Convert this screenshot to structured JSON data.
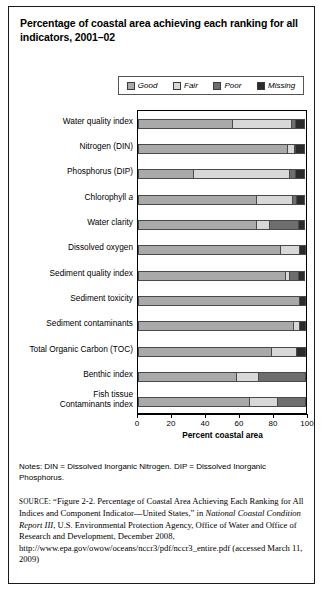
{
  "title": "Percentage of coastal area achieving each ranking for all indicators, 2001–02",
  "legend": {
    "items": [
      {
        "label": "Good",
        "color": "#a9a9a9"
      },
      {
        "label": "Fair",
        "color": "#d8d8d8"
      },
      {
        "label": "Poor",
        "color": "#6e6e6e"
      },
      {
        "label": "Missing",
        "color": "#2b2b2b"
      }
    ]
  },
  "notes": "Notes: DIN = Dissolved Inorganic Nitrogen. DIP = Dissolved Inorganic Phosphorus.",
  "source": {
    "label": "SOURCE",
    "text_1": ": “Figure 2-2. Percentage of Coastal Area Achieving Each Ranking for All Indices and Component Indicator—United States,” in ",
    "italic_1": "National Coastal Condition Report III",
    "text_2": ", U.S. Environmental Protection Agency, Office of Water and Office of Research and Development, December 2008, http://www.epa.gov/owow/oceans/nccr3/pdf/nccr3_entire.pdf (accessed March 11, 2009)"
  },
  "chart_data": {
    "type": "bar",
    "orientation": "horizontal",
    "stacked": true,
    "title": "Percentage of coastal area achieving each ranking for all indicators, 2001–02",
    "xlabel": "Percent coastal area",
    "ylabel": "",
    "xlim": [
      0,
      100
    ],
    "xticks": [
      0,
      20,
      40,
      60,
      80,
      100
    ],
    "xticklabels": [
      "0",
      "20",
      "40",
      "60",
      "80",
      "100"
    ],
    "grid": false,
    "legend_position": "top",
    "legend_entries": [
      "Good",
      "Fair",
      "Poor",
      "Missing"
    ],
    "categories": [
      "Water quality index",
      "Nitrogen (DIN)",
      "Phosphorus (DIP)",
      "Chlorophyll a",
      "Water clarity",
      "Dissolved oxygen",
      "Sediment quality index",
      "Sediment toxicity",
      "Sediment contaminants",
      "Total Organic Carbon (TOC)",
      "Benthic index",
      "Fish tissue Contaminants index"
    ],
    "series": [
      {
        "name": "Good",
        "values": [
          56,
          88,
          33,
          70,
          70,
          84,
          87,
          96,
          92,
          79,
          58,
          66
        ]
      },
      {
        "name": "Fair",
        "values": [
          35,
          5,
          57,
          22,
          8,
          12,
          3,
          0,
          4,
          15,
          14,
          17
        ]
      },
      {
        "name": "Poor",
        "values": [
          3,
          1,
          4,
          3,
          18,
          0,
          6,
          0,
          0,
          0,
          28,
          17
        ]
      },
      {
        "name": "Missing",
        "values": [
          6,
          6,
          6,
          5,
          4,
          4,
          4,
          4,
          4,
          6,
          0,
          0
        ]
      }
    ]
  }
}
